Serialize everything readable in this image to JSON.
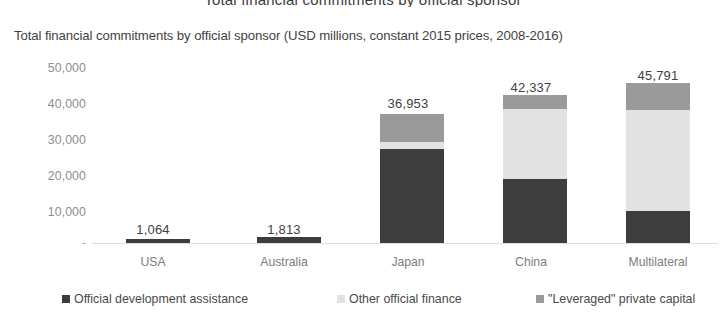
{
  "chart_data": {
    "type": "bar",
    "stacked": true,
    "title": "Total financial commitments by official sponsor",
    "subtitle": "Total financial commitments by official sponsor (USD millions, constant 2015 prices, 2008-2016)",
    "xlabel": "",
    "ylabel": "",
    "ylim": [
      0,
      50000
    ],
    "yticks": [
      "-",
      "10,000",
      "20,000",
      "30,000",
      "40,000",
      "50,000"
    ],
    "ytick_values": [
      0,
      10000,
      20000,
      30000,
      40000,
      50000
    ],
    "grid": false,
    "legend_position": "bottom",
    "categories": [
      "USA",
      "Australia",
      "Japan",
      "China",
      "Multilateral"
    ],
    "series": [
      {
        "name": "Official development assistance",
        "color": "#3d3d3d",
        "values": [
          1064,
          1813,
          26900,
          18400,
          9100
        ]
      },
      {
        "name": "Other official finance",
        "color": "#e2e2e2",
        "values": [
          0,
          0,
          2100,
          19900,
          28900
        ]
      },
      {
        "name": "\"Leveraged\" private capital",
        "color": "#9a9a9a",
        "values": [
          0,
          0,
          7953,
          4037,
          7791
        ]
      }
    ],
    "totals": [
      1064,
      1813,
      36953,
      42337,
      45791
    ],
    "total_labels": [
      "1,064",
      "1,813",
      "36,953",
      "42,337",
      "45,791"
    ]
  },
  "legend": {
    "items": [
      {
        "label": "Official development assistance",
        "color": "#3d3d3d"
      },
      {
        "label": "Other official finance",
        "color": "#e2e2e2"
      },
      {
        "label": "\"Leveraged\" private capital",
        "color": "#9a9a9a"
      }
    ]
  }
}
